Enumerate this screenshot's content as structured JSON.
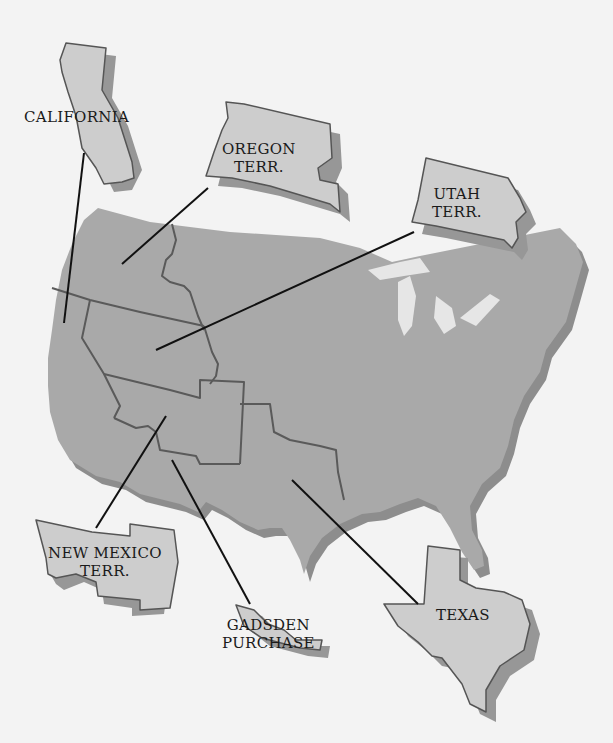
{
  "map": {
    "title": "Territorial acquisitions of the United States",
    "colors": {
      "background": "#f3f3f3",
      "mainland_fill": "#a9a9a9",
      "mainland_shadow": "#8d8d8d",
      "territory_fill": "#cdcdcd",
      "territory_outline": "#555555",
      "territory_shadow": "#979797",
      "leader_line": "#111111",
      "border_line": "#5a5a5a",
      "label_text": "#1a1a1a"
    },
    "labels": {
      "california": "CALIFORNIA",
      "oregon_line1": "OREGON",
      "oregon_line2": "TERR.",
      "utah_line1": "UTAH",
      "utah_line2": "TERR.",
      "new_mexico_line1": "NEW MEXICO",
      "new_mexico_line2": "TERR.",
      "gadsden_line1": "GADSDEN",
      "gadsden_line2": "PURCHASE",
      "texas": "TEXAS"
    }
  }
}
